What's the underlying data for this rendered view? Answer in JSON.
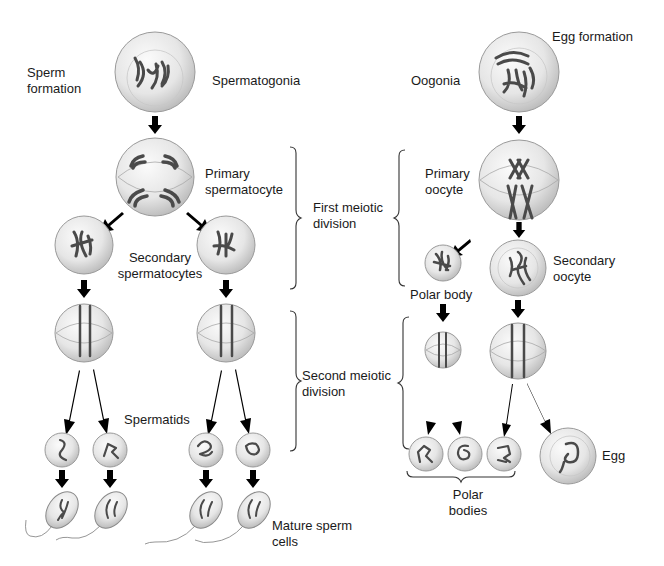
{
  "title_left": "Sperm formation",
  "title_right": "Egg formation",
  "sperm": {
    "spermatogonia": "Spermatogonia",
    "primary": "Primary spermatocyte",
    "secondary": "Secondary spermatocytes",
    "spermatids": "Spermatids",
    "mature": "Mature sperm cells"
  },
  "egg": {
    "oogonia": "Oogonia",
    "primary": "Primary oocyte",
    "secondary": "Secondary oocyte",
    "polar_body": "Polar body",
    "polar_bodies": "Polar bodies",
    "egg": "Egg"
  },
  "divisions": {
    "first": "First meiotic division",
    "second": "Second meiotic division"
  },
  "colors": {
    "arrow": "#000000",
    "cell_fill": "#e8e8e8",
    "chromosome": "#4a4a4a",
    "text": "#1a1a1a"
  }
}
